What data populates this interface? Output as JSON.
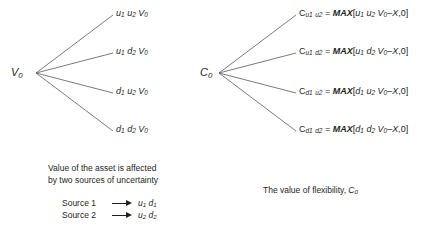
{
  "figure": {
    "background_color": "#ffffff",
    "line_color": "#58595b",
    "text_color": "#231f20"
  },
  "left_tree": {
    "root_label": "V",
    "root_sub": "0",
    "leaves": [
      {
        "u1": "u",
        "s1": "1",
        "u2": "u",
        "s2": "2",
        "v": "V",
        "vs": "0"
      },
      {
        "u1": "u",
        "s1": "1",
        "u2": "d",
        "s2": "2",
        "v": "V",
        "vs": "0"
      },
      {
        "u1": "d",
        "s1": "1",
        "u2": "u",
        "s2": "2",
        "v": "V",
        "vs": "0"
      },
      {
        "u1": "d",
        "s1": "1",
        "u2": "d",
        "s2": "2",
        "v": "V",
        "vs": "0"
      }
    ],
    "leaf_texts": [
      "u1 u2 V0",
      "u1 d2 V0",
      "d1 u2 V0",
      "d1 d2 V0"
    ],
    "caption": "Value of the asset is affected\nby two sources of uncertainty"
  },
  "right_tree": {
    "root_label": "C",
    "root_sub": "0",
    "payoffs": [
      {
        "c": "C",
        "c_sub_a": "u",
        "c_sub_a_num": "1",
        "c_sub_b": "u",
        "c_sub_b_num": "2",
        "eq": "=",
        "max": "MAX",
        "open": "[",
        "t1": "u",
        "t1n": "1",
        "t2": "u",
        "t2n": "2",
        "v": "V",
        "vn": "0",
        "minus": "–",
        "strike": "X",
        "comma_zero": ",0",
        "close": "]"
      },
      {
        "c": "C",
        "c_sub_a": "u",
        "c_sub_a_num": "1",
        "c_sub_b": "d",
        "c_sub_b_num": "2",
        "eq": "=",
        "max": "MAX",
        "open": "[",
        "t1": "u",
        "t1n": "1",
        "t2": "d",
        "t2n": "2",
        "v": "V",
        "vn": "0",
        "minus": "–",
        "strike": "X",
        "comma_zero": ",0",
        "close": "]"
      },
      {
        "c": "C",
        "c_sub_a": "d",
        "c_sub_a_num": "1",
        "c_sub_b": "u",
        "c_sub_b_num": "2",
        "eq": "=",
        "max": "MAX",
        "open": "[",
        "t1": "d",
        "t1n": "1",
        "t2": "u",
        "t2n": "2",
        "v": "V",
        "vn": "0",
        "minus": "–",
        "strike": "X",
        "comma_zero": ",0",
        "close": "]"
      },
      {
        "c": "C",
        "c_sub_a": "d",
        "c_sub_a_num": "1",
        "c_sub_b": "d",
        "c_sub_b_num": "2",
        "eq": "=",
        "max": "MAX",
        "open": "[",
        "t1": "d",
        "t1n": "1",
        "t2": "d",
        "t2n": "2",
        "v": "V",
        "vn": "0",
        "minus": "–",
        "strike": "X",
        "comma_zero": ",0",
        "close": "]"
      }
    ],
    "payoff_texts": [
      "Cu1 u2 = MAX[u1 u2 V0 - X,0]",
      "Cu1 d2 = MAX[u1 d2 V0 - X,0]",
      "Cd1 u2 = MAX[d1 u2 V0 - X,0]",
      "Cd1 d2 = MAX[d1 d2 V0 - X,0]"
    ],
    "caption_prefix": "The value of flexibility, ",
    "caption_symbol": "C",
    "caption_symbol_sub": "0"
  },
  "legend": {
    "rows": [
      {
        "label": "Source 1",
        "arrow": "right-arrow",
        "v1": "u",
        "v1n": "1",
        "v2": "d",
        "v2n": "1"
      },
      {
        "label": "Source 2",
        "arrow": "right-arrow",
        "v1": "u",
        "v1n": "2",
        "v2": "d",
        "v2n": "2"
      }
    ]
  }
}
